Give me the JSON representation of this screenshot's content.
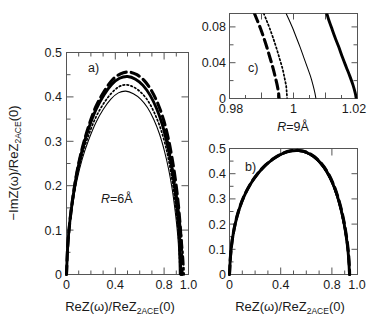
{
  "figure": {
    "width": 367,
    "height": 332,
    "background": "#ffffff",
    "ink": "#000000"
  },
  "chart_data": [
    {
      "id": "panel-a",
      "type": "line",
      "title": "a)",
      "panel_tag": "a)",
      "annotation": "R=6Å",
      "annotation_parts": {
        "symbol": "R",
        "value": "=6Å"
      },
      "xlabel": "ReZ(ω)/ReZ_2ACE(0)",
      "xlabel_parts": {
        "pre": "ReZ(ω)/ReZ",
        "sub": "2ACE",
        "post": "(0)"
      },
      "ylabel": "−ImZ(ω)/ReZ_2ACE(0)",
      "ylabel_parts": {
        "pre": "−ImZ(ω)/ReZ",
        "sub": "2ACE",
        "post": "(0)"
      },
      "xlim": [
        0,
        1.04
      ],
      "ylim": [
        0,
        0.5
      ],
      "xticks": [
        0,
        0.2,
        0.4,
        0.6,
        0.8,
        1.0
      ],
      "xticklabels": [
        "0",
        "",
        "0.4",
        "",
        "0.8",
        "1.0"
      ],
      "yticks": [
        0,
        0.1,
        0.2,
        0.3,
        0.4,
        0.5
      ],
      "yticklabels": [
        "0",
        "0.1",
        "0.2",
        "0.3",
        "0.4",
        "0.5"
      ],
      "grid": false,
      "legend": "none",
      "series": [
        {
          "name": "thick-dashed",
          "style": "thick-dashed",
          "peak": 0.456,
          "x_end": 0.985,
          "x": [
            0.0,
            0.01,
            0.028,
            0.055,
            0.09,
            0.135,
            0.19,
            0.25,
            0.32,
            0.39,
            0.46,
            0.53,
            0.6,
            0.665,
            0.725,
            0.78,
            0.828,
            0.868,
            0.9,
            0.928,
            0.95,
            0.966,
            0.976,
            0.982,
            0.985
          ],
          "y": [
            0.0,
            0.062,
            0.118,
            0.175,
            0.232,
            0.285,
            0.335,
            0.378,
            0.412,
            0.438,
            0.452,
            0.456,
            0.45,
            0.436,
            0.414,
            0.384,
            0.348,
            0.306,
            0.262,
            0.214,
            0.166,
            0.12,
            0.08,
            0.04,
            0.0
          ]
        },
        {
          "name": "thick-solid",
          "style": "thick-solid",
          "peak": 0.446,
          "x_end": 0.975,
          "x": [
            0.0,
            0.01,
            0.028,
            0.055,
            0.09,
            0.135,
            0.19,
            0.25,
            0.318,
            0.385,
            0.452,
            0.52,
            0.588,
            0.652,
            0.712,
            0.766,
            0.814,
            0.854,
            0.888,
            0.916,
            0.938,
            0.954,
            0.965,
            0.971,
            0.975
          ],
          "y": [
            0.0,
            0.062,
            0.118,
            0.174,
            0.23,
            0.282,
            0.33,
            0.371,
            0.404,
            0.428,
            0.442,
            0.446,
            0.44,
            0.426,
            0.404,
            0.375,
            0.34,
            0.299,
            0.255,
            0.208,
            0.161,
            0.116,
            0.077,
            0.038,
            0.0
          ]
        },
        {
          "name": "dotted",
          "style": "dotted",
          "peak": 0.427,
          "x_end": 0.968,
          "x": [
            0.0,
            0.01,
            0.028,
            0.055,
            0.09,
            0.135,
            0.19,
            0.25,
            0.316,
            0.382,
            0.448,
            0.514,
            0.58,
            0.643,
            0.702,
            0.756,
            0.804,
            0.846,
            0.88,
            0.908,
            0.93,
            0.947,
            0.958,
            0.964,
            0.968
          ],
          "y": [
            0.0,
            0.06,
            0.114,
            0.168,
            0.221,
            0.27,
            0.315,
            0.354,
            0.385,
            0.408,
            0.423,
            0.427,
            0.421,
            0.408,
            0.388,
            0.36,
            0.327,
            0.288,
            0.245,
            0.2,
            0.155,
            0.112,
            0.074,
            0.037,
            0.0
          ]
        },
        {
          "name": "thin-solid",
          "style": "thin-solid",
          "peak": 0.413,
          "x_end": 0.962,
          "x": [
            0.0,
            0.01,
            0.028,
            0.055,
            0.09,
            0.135,
            0.19,
            0.25,
            0.314,
            0.378,
            0.442,
            0.506,
            0.57,
            0.632,
            0.69,
            0.744,
            0.792,
            0.834,
            0.87,
            0.9,
            0.923,
            0.941,
            0.953,
            0.959,
            0.962
          ],
          "y": [
            0.0,
            0.058,
            0.11,
            0.162,
            0.213,
            0.261,
            0.304,
            0.342,
            0.372,
            0.395,
            0.409,
            0.413,
            0.407,
            0.395,
            0.376,
            0.349,
            0.317,
            0.279,
            0.238,
            0.194,
            0.15,
            0.108,
            0.071,
            0.035,
            0.0
          ]
        },
        {
          "name": "dash-dot",
          "style": "dash-dot",
          "peak": 0.205,
          "x_end": 1.0,
          "x": [
            0.862,
            0.882,
            0.9,
            0.916,
            0.932,
            0.946,
            0.958,
            0.968,
            0.977,
            0.984,
            0.99,
            0.995,
            0.998,
            1.0
          ],
          "y": [
            0.3,
            0.272,
            0.244,
            0.216,
            0.189,
            0.162,
            0.136,
            0.112,
            0.089,
            0.068,
            0.049,
            0.032,
            0.015,
            0.0
          ]
        }
      ]
    },
    {
      "id": "panel-b",
      "type": "line",
      "title": "b)",
      "panel_tag": "b)",
      "annotation": "",
      "xlabel": "ReZ(ω)/ReZ_2ACE(0)",
      "xlabel_parts": {
        "pre": "ReZ(ω)/ReZ",
        "sub": "2ACE",
        "post": "(0)"
      },
      "xlim": [
        0,
        1.04
      ],
      "ylim": [
        0,
        0.5
      ],
      "xticks": [
        0,
        0.2,
        0.4,
        0.6,
        0.8,
        1.0
      ],
      "xticklabels": [
        "0",
        "",
        "0.4",
        "",
        "0.8",
        "1.0"
      ],
      "yticks": [
        0,
        0.1,
        0.2,
        0.3,
        0.4,
        0.5
      ],
      "yticklabels": [
        "0",
        "0.1",
        "0.2",
        "0.3",
        "0.4",
        "0.5"
      ],
      "grid": false,
      "legend": "none",
      "series": [
        {
          "name": "thick-solid",
          "style": "thick-solid",
          "peak": 0.492,
          "x_end": 0.975,
          "x": [
            0.0,
            0.008,
            0.022,
            0.045,
            0.078,
            0.12,
            0.172,
            0.23,
            0.294,
            0.36,
            0.428,
            0.495,
            0.56,
            0.625,
            0.686,
            0.742,
            0.793,
            0.837,
            0.874,
            0.905,
            0.93,
            0.949,
            0.962,
            0.97,
            0.975
          ],
          "y": [
            0.0,
            0.072,
            0.136,
            0.198,
            0.258,
            0.312,
            0.36,
            0.4,
            0.434,
            0.46,
            0.479,
            0.49,
            0.492,
            0.485,
            0.468,
            0.442,
            0.407,
            0.364,
            0.315,
            0.261,
            0.205,
            0.149,
            0.098,
            0.049,
            0.0
          ]
        },
        {
          "name": "thick-dashed",
          "style": "thick-dashed",
          "peak": 0.492,
          "x_end": 0.976,
          "x": [
            0.0,
            0.008,
            0.022,
            0.045,
            0.078,
            0.12,
            0.172,
            0.23,
            0.294,
            0.361,
            0.429,
            0.496,
            0.562,
            0.627,
            0.688,
            0.744,
            0.795,
            0.839,
            0.876,
            0.907,
            0.932,
            0.951,
            0.964,
            0.972,
            0.976
          ],
          "y": [
            0.0,
            0.072,
            0.136,
            0.199,
            0.259,
            0.313,
            0.361,
            0.401,
            0.435,
            0.461,
            0.48,
            0.491,
            0.492,
            0.485,
            0.468,
            0.442,
            0.407,
            0.364,
            0.315,
            0.261,
            0.205,
            0.149,
            0.098,
            0.049,
            0.0
          ]
        },
        {
          "name": "dotted",
          "style": "dotted",
          "peak": 0.49,
          "x_end": 0.973,
          "x": [
            0.0,
            0.008,
            0.022,
            0.045,
            0.078,
            0.12,
            0.172,
            0.229,
            0.292,
            0.358,
            0.426,
            0.493,
            0.558,
            0.622,
            0.683,
            0.739,
            0.79,
            0.834,
            0.871,
            0.902,
            0.927,
            0.947,
            0.96,
            0.968,
            0.973
          ],
          "y": [
            0.0,
            0.071,
            0.135,
            0.197,
            0.257,
            0.311,
            0.359,
            0.399,
            0.432,
            0.458,
            0.477,
            0.488,
            0.49,
            0.483,
            0.466,
            0.44,
            0.405,
            0.363,
            0.314,
            0.26,
            0.204,
            0.148,
            0.098,
            0.049,
            0.0
          ]
        },
        {
          "name": "thin-solid",
          "style": "thin-solid",
          "peak": 0.489,
          "x_end": 0.971,
          "x": [
            0.0,
            0.008,
            0.022,
            0.045,
            0.078,
            0.12,
            0.171,
            0.228,
            0.291,
            0.357,
            0.424,
            0.491,
            0.556,
            0.62,
            0.681,
            0.736,
            0.787,
            0.831,
            0.868,
            0.899,
            0.925,
            0.945,
            0.958,
            0.966,
            0.971
          ],
          "y": [
            0.0,
            0.071,
            0.134,
            0.196,
            0.256,
            0.31,
            0.358,
            0.398,
            0.431,
            0.457,
            0.476,
            0.487,
            0.489,
            0.482,
            0.465,
            0.439,
            0.404,
            0.362,
            0.313,
            0.259,
            0.203,
            0.148,
            0.097,
            0.049,
            0.0
          ]
        }
      ]
    },
    {
      "id": "panel-c",
      "type": "line",
      "title": "c)",
      "panel_tag": "c)",
      "annotation": "R=9Å",
      "annotation_parts": {
        "symbol": "R",
        "value": "=9Å"
      },
      "xlabel": "",
      "xlim": [
        0.98,
        1.02
      ],
      "ylim": [
        0,
        0.095
      ],
      "xticks": [
        0.98,
        0.99,
        1.0,
        1.01,
        1.02
      ],
      "xticklabels": [
        "0.98",
        "",
        "1",
        "",
        "1.02"
      ],
      "yticks": [
        0,
        0.02,
        0.04,
        0.06,
        0.08
      ],
      "yticklabels": [
        "0",
        "",
        "0.04",
        "",
        "0.08"
      ],
      "grid": false,
      "legend": "none",
      "series": [
        {
          "name": "thick-dashed",
          "style": "thick-dashed",
          "x": [
            0.9878,
            0.9886,
            0.9896,
            0.9906,
            0.9917,
            0.9927,
            0.9936,
            0.9943,
            0.9949,
            0.9953,
            0.9955
          ],
          "y": [
            0.095,
            0.088,
            0.079,
            0.069,
            0.057,
            0.045,
            0.034,
            0.024,
            0.015,
            0.007,
            0.0
          ]
        },
        {
          "name": "dotted",
          "style": "dotted",
          "x": [
            0.9907,
            0.9915,
            0.9925,
            0.9936,
            0.9947,
            0.9957,
            0.9966,
            0.9972,
            0.9977,
            0.9979,
            0.998
          ],
          "y": [
            0.095,
            0.088,
            0.079,
            0.068,
            0.056,
            0.044,
            0.033,
            0.023,
            0.014,
            0.006,
            0.0
          ]
        },
        {
          "name": "thin-solid",
          "style": "thin-solid",
          "x": [
            0.9977,
            0.9986,
            0.9997,
            1.0008,
            1.002,
            1.0032,
            1.0043,
            1.0053,
            1.0061,
            1.0067,
            1.007
          ],
          "y": [
            0.095,
            0.088,
            0.079,
            0.069,
            0.058,
            0.046,
            0.035,
            0.025,
            0.015,
            0.006,
            0.0
          ]
        },
        {
          "name": "thick-solid",
          "style": "thick-solid",
          "x": [
            1.0104,
            1.011,
            1.0119,
            1.0129,
            1.0141,
            1.0153,
            1.0165,
            1.0176,
            1.0186,
            1.0193,
            1.0196
          ],
          "y": [
            0.095,
            0.088,
            0.079,
            0.069,
            0.058,
            0.046,
            0.035,
            0.025,
            0.015,
            0.006,
            0.0
          ]
        }
      ]
    }
  ]
}
